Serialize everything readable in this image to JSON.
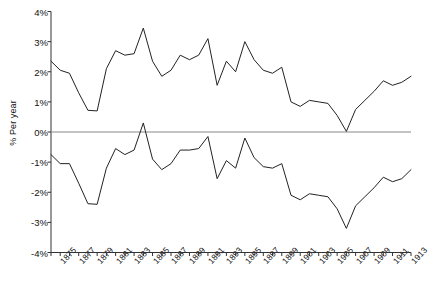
{
  "chart_data": {
    "type": "line",
    "title": "",
    "subtitle": "",
    "xlabel": "",
    "ylabel": "% Per year",
    "xlim": [
      1874,
      1913
    ],
    "ylim": [
      -4,
      4
    ],
    "grid": false,
    "legend_position": "none",
    "y_tick_labels": [
      "4%",
      "3%",
      "2%",
      "1%",
      "0%",
      "-1%",
      "-2%",
      "-3%",
      "-4%"
    ],
    "y_tick_values": [
      4,
      3,
      2,
      1,
      0,
      -1,
      -2,
      -3,
      -4
    ],
    "x_tick_labels": [
      "1875",
      "1877",
      "1879",
      "1881",
      "1883",
      "1885",
      "1887",
      "1889",
      "1891",
      "1893",
      "1895",
      "1897",
      "1899",
      "1901",
      "1903",
      "1905",
      "1907",
      "1909",
      "1911",
      "1913"
    ],
    "x_tick_values": [
      1875,
      1877,
      1879,
      1881,
      1883,
      1885,
      1887,
      1889,
      1891,
      1893,
      1895,
      1897,
      1899,
      1901,
      1903,
      1905,
      1907,
      1909,
      1911,
      1913
    ],
    "zero_line": 0,
    "x": [
      1874,
      1875,
      1876,
      1877,
      1878,
      1879,
      1880,
      1881,
      1882,
      1883,
      1884,
      1885,
      1886,
      1887,
      1888,
      1889,
      1890,
      1891,
      1892,
      1893,
      1894,
      1895,
      1896,
      1897,
      1898,
      1899,
      1900,
      1901,
      1902,
      1903,
      1904,
      1905,
      1906,
      1907,
      1908,
      1909,
      1910,
      1911,
      1912,
      1913
    ],
    "series": [
      {
        "name": "upper",
        "color": "#222222",
        "values": [
          2.35,
          2.05,
          1.95,
          1.3,
          0.72,
          0.7,
          2.1,
          2.7,
          2.55,
          2.6,
          3.45,
          2.35,
          1.85,
          2.05,
          2.55,
          2.4,
          2.55,
          3.1,
          1.55,
          2.35,
          2.0,
          3.0,
          2.4,
          2.05,
          1.95,
          2.15,
          1.0,
          0.85,
          1.05,
          1.0,
          0.95,
          0.55,
          0.02,
          0.75,
          1.05,
          1.35,
          1.7,
          1.55,
          1.65,
          1.85
        ]
      },
      {
        "name": "lower",
        "color": "#222222",
        "values": [
          -0.75,
          -1.05,
          -1.05,
          -1.7,
          -2.38,
          -2.4,
          -1.2,
          -0.55,
          -0.75,
          -0.6,
          0.3,
          -0.9,
          -1.25,
          -1.05,
          -0.6,
          -0.6,
          -0.55,
          -0.15,
          -1.55,
          -0.95,
          -1.2,
          -0.2,
          -0.85,
          -1.15,
          -1.2,
          -1.05,
          -2.1,
          -2.25,
          -2.05,
          -2.1,
          -2.15,
          -2.55,
          -3.2,
          -2.45,
          -2.15,
          -1.85,
          -1.5,
          -1.65,
          -1.55,
          -1.25
        ]
      }
    ]
  }
}
